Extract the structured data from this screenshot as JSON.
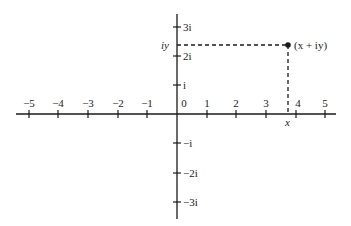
{
  "diagram": {
    "type": "complex-plane",
    "x_axis": {
      "ticks": [
        {
          "value": -5,
          "label": "−5"
        },
        {
          "value": -4,
          "label": "−4"
        },
        {
          "value": -3,
          "label": "−3"
        },
        {
          "value": -2,
          "label": "−2"
        },
        {
          "value": -1,
          "label": "−1"
        },
        {
          "value": 0,
          "label": "0"
        },
        {
          "value": 1,
          "label": "1"
        },
        {
          "value": 2,
          "label": "2"
        },
        {
          "value": 3,
          "label": "3"
        },
        {
          "value": 4,
          "label": "4"
        },
        {
          "value": 5,
          "label": "5"
        }
      ]
    },
    "y_axis": {
      "ticks": [
        {
          "value": 3,
          "label": "3i"
        },
        {
          "value": 2,
          "label": "2i"
        },
        {
          "value": 1,
          "label": "i"
        },
        {
          "value": -1,
          "label": "−i"
        },
        {
          "value": -2,
          "label": "−2i"
        },
        {
          "value": -3,
          "label": "−3i"
        }
      ]
    },
    "point": {
      "label": "(x + iy)",
      "x_label": "x",
      "y_label": "iy",
      "approx_x": 3.75,
      "approx_y": 2.4,
      "color": "#1a1a1a"
    },
    "line_color": "#1a1a1a"
  }
}
